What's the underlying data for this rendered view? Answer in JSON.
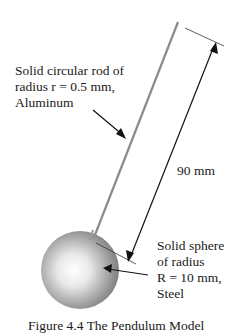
{
  "rod_label": {
    "line1": "Solid circular rod of",
    "line2": "radius r = 0.5 mm,",
    "line3": "Aluminum"
  },
  "length_label": "90 mm",
  "sphere_label": {
    "line1": "Solid sphere",
    "line2": "of radius",
    "line3": "R = 10 mm,",
    "line4": "Steel"
  },
  "caption": "Figure 4.4 The Pendulum Model"
}
